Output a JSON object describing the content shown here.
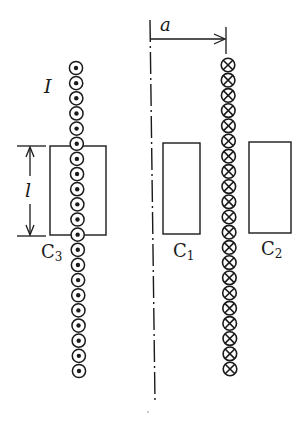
{
  "diagram": {
    "type": "physics-schematic",
    "labels": {
      "current": "I",
      "distance": "a",
      "length": "l",
      "c1": "C",
      "c1_sub": "1",
      "c2": "C",
      "c2_sub": "2",
      "c3": "C",
      "c3_sub": "3"
    },
    "left_sheet": {
      "symbol": "dot-in-circle",
      "direction": "out-of-page",
      "count": 21
    },
    "right_sheet": {
      "symbol": "cross-in-circle",
      "direction": "into-page",
      "count": 21
    },
    "colors": {
      "stroke": "#1a1a1a",
      "background": "#ffffff"
    }
  }
}
